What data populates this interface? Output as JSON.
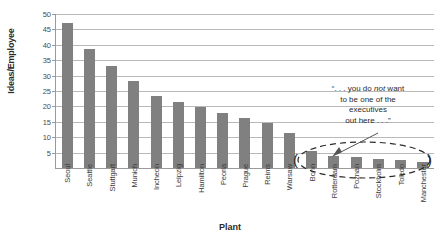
{
  "chart_data": {
    "type": "bar",
    "title": "",
    "xlabel": "Plant",
    "ylabel": "Ideas/Employee",
    "ylim": [
      0,
      50
    ],
    "yticks": [
      5,
      10,
      15,
      20,
      25,
      30,
      35,
      40,
      45,
      50
    ],
    "grid": true,
    "legend": "none",
    "bar_color": "#808080",
    "categories": [
      "Seoul",
      "Seattle",
      "Stuttgart",
      "Munich",
      "Incheon",
      "Leipzig",
      "Hamilton",
      "Peoria",
      "Prague",
      "Reims",
      "Warsaw",
      "Bonn",
      "Rotterdam",
      "Poznan",
      "Stockholm",
      "Toledo",
      "Manchester"
    ],
    "values": [
      47,
      38.5,
      33,
      28.2,
      23.5,
      21.3,
      19.8,
      17.8,
      16.3,
      14.5,
      11.5,
      5.5,
      4,
      3.5,
      2.8,
      2.5,
      2
    ],
    "annotations": [
      {
        "name": "executives-callout",
        "text_parts": [
          "“. . . you do ",
          "not",
          " want to be one of the executives out here . . .”"
        ],
        "line1": "“. . . you do ",
        "emphasis": "not",
        "line1_tail": " want",
        "line2": "to be one of the",
        "line3": "executives",
        "line4": "out here . . .”",
        "points_to": [
          "Bonn",
          "Rotterdam",
          "Poznan",
          "Stockholm",
          "Toledo",
          "Manchester"
        ]
      }
    ],
    "highlight": {
      "shape": "dashed-ellipse",
      "left_marker": "(",
      "right_marker": ")",
      "covers": [
        "Bonn",
        "Rotterdam",
        "Poznan",
        "Stockholm",
        "Toledo",
        "Manchester"
      ]
    }
  }
}
